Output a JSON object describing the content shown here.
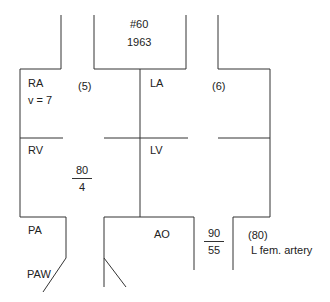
{
  "header": {
    "id": "#60",
    "year": "1963"
  },
  "chambers": {
    "ra": {
      "label": "RA",
      "sub": "v = 7",
      "pressure": "(5)"
    },
    "la": {
      "label": "LA",
      "pressure": "(6)"
    },
    "rv": {
      "label": "RV",
      "pressure": {
        "systolic": "80",
        "diastolic": "4"
      }
    },
    "lv": {
      "label": "LV"
    },
    "pa": {
      "label": "PA"
    },
    "paw": {
      "label": "PAW"
    },
    "ao": {
      "label": "AO",
      "pressure": {
        "systolic": "90",
        "diastolic": "55"
      }
    },
    "femoral": {
      "pressure": "(80)",
      "label": "L fem. artery"
    }
  },
  "colors": {
    "line": "#333333",
    "text": "#222222",
    "background": "#ffffff"
  }
}
